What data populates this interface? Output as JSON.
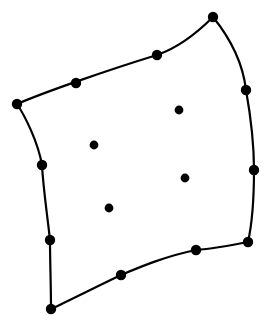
{
  "figure": {
    "background_color": "#ffffff",
    "stroke_color": "#000000",
    "node_color": "#000000",
    "interior_dot_color": "#000000",
    "edge_stroke_width": 2.2,
    "boundary_node_radius": 5.2,
    "interior_dot_radius": 4.4,
    "canvas": {
      "width": 272,
      "height": 324
    }
  },
  "chart_data": {
    "type": "scatter",
    "xlabel": "",
    "ylabel": "",
    "xlim": [
      0,
      272
    ],
    "ylim": [
      324,
      0
    ],
    "grid": false,
    "legend": null,
    "annotations": [],
    "corners": [
      {
        "name": "top-left",
        "x": 17,
        "y": 104
      },
      {
        "name": "top-right",
        "x": 213,
        "y": 17
      },
      {
        "name": "bottom-right",
        "x": 248,
        "y": 242
      },
      {
        "name": "bottom-left",
        "x": 51,
        "y": 309
      }
    ],
    "edge_midside_nodes": [
      {
        "name": "top-edge-1",
        "x": 76,
        "y": 83
      },
      {
        "name": "top-edge-2",
        "x": 157,
        "y": 55
      },
      {
        "name": "right-edge-1",
        "x": 246,
        "y": 90
      },
      {
        "name": "right-edge-2",
        "x": 254,
        "y": 170
      },
      {
        "name": "bottom-edge-1",
        "x": 196,
        "y": 250
      },
      {
        "name": "bottom-edge-2",
        "x": 121,
        "y": 275
      },
      {
        "name": "left-edge-1",
        "x": 50,
        "y": 240
      },
      {
        "name": "left-edge-2",
        "x": 42,
        "y": 165
      }
    ],
    "interior_nodes": [
      {
        "name": "interior-1",
        "x": 94,
        "y": 145
      },
      {
        "name": "interior-2",
        "x": 179,
        "y": 110
      },
      {
        "name": "interior-3",
        "x": 185,
        "y": 178
      },
      {
        "name": "interior-4",
        "x": 109,
        "y": 208
      }
    ],
    "edges": [
      {
        "name": "top-edge",
        "from": "top-left",
        "to": "top-right",
        "path": "M 17 104 C 45 92, 108 70, 157 55 C 180 47, 200 30, 213 17"
      },
      {
        "name": "right-edge",
        "from": "top-right",
        "to": "bottom-right",
        "path": "M 213 17 C 230 38, 243 64, 246 90 C 251 118, 254 146, 254 170 C 254 196, 252 224, 248 242"
      },
      {
        "name": "bottom-edge",
        "from": "bottom-right",
        "to": "bottom-left",
        "path": "M 248 242 C 228 246, 210 249, 196 250 C 166 256, 140 267, 121 275 C 96 287, 68 301, 51 309"
      },
      {
        "name": "left-edge",
        "from": "bottom-left",
        "to": "top-left",
        "path": "M 51 309 C 51 286, 50 261, 50 240 C 47 213, 43 186, 42 165 C 38 142, 25 116, 17 104"
      }
    ]
  }
}
